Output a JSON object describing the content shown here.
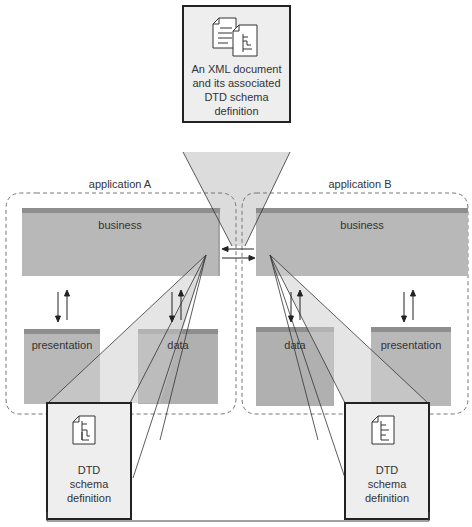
{
  "diagram": {
    "top_doc": {
      "lines": [
        "An XML document",
        "and its associated",
        "DTD schema",
        "definition"
      ],
      "icon": "xml-and-dtd-documents-icon"
    },
    "application_a": {
      "label": "application A",
      "layers": {
        "business": "business",
        "presentation": "presentation",
        "data": "data"
      },
      "dtd": {
        "lines": [
          "DTD",
          "schema",
          "definition"
        ],
        "icon": "dtd-document-icon"
      }
    },
    "application_b": {
      "label": "application B",
      "layers": {
        "business": "business",
        "presentation": "presentation",
        "data": "data"
      },
      "dtd": {
        "lines": [
          "DTD",
          "schema",
          "definition"
        ],
        "icon": "dtd-document-icon"
      }
    },
    "colors": {
      "block_face": "#b8b8b8",
      "block_top": "#8e8e8e",
      "block_side": "#a4a4a4",
      "beam": "#dcdcdc",
      "callout_bg": "#eeeeee",
      "border": "#222222",
      "dashed": "#777777"
    }
  }
}
